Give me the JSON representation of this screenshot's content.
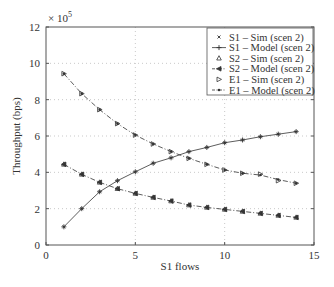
{
  "chart_data": {
    "type": "line",
    "title": "",
    "xlabel": "S1 flows",
    "ylabel": "Throughput (bps)",
    "y_multiplier": "× 10",
    "y_multiplier_exp": "5",
    "xlim": [
      0,
      15
    ],
    "ylim": [
      0,
      12
    ],
    "xticks": [
      0,
      5,
      10,
      15
    ],
    "yticks": [
      0,
      2,
      4,
      6,
      8,
      10,
      12
    ],
    "grid": true,
    "legend_position": "upper right",
    "x": [
      1,
      2,
      3,
      4,
      5,
      6,
      7,
      8,
      9,
      10,
      11,
      12,
      13,
      14
    ],
    "series": [
      {
        "name": "S1 – Sim (scen 2)",
        "marker": "x",
        "line": "none",
        "values": [
          1.0,
          2.0,
          2.93,
          3.54,
          4.03,
          4.5,
          4.8,
          5.14,
          5.37,
          5.63,
          5.78,
          5.96,
          6.1,
          6.24
        ]
      },
      {
        "name": "S1 – Model (scen 2)",
        "marker": "+",
        "line": "solid",
        "values": [
          1.0,
          2.0,
          2.93,
          3.54,
          4.03,
          4.5,
          4.8,
          5.14,
          5.37,
          5.63,
          5.78,
          5.96,
          6.1,
          6.24
        ]
      },
      {
        "name": "S2 – Sim (scen 2)",
        "marker": "triangle-up",
        "line": "none",
        "values": [
          4.44,
          3.89,
          3.45,
          3.1,
          2.84,
          2.62,
          2.42,
          2.2,
          2.07,
          1.96,
          1.85,
          1.74,
          1.63,
          1.52
        ]
      },
      {
        "name": "S2 – Model (scen 2)",
        "marker": "triangle-left",
        "line": "dashdot",
        "values": [
          4.44,
          3.89,
          3.45,
          3.1,
          2.84,
          2.62,
          2.42,
          2.2,
          2.07,
          1.96,
          1.85,
          1.74,
          1.63,
          1.52
        ]
      },
      {
        "name": "E1 – Sim (scen 2)",
        "marker": "triangle-right",
        "line": "none",
        "values": [
          9.43,
          8.33,
          7.45,
          6.68,
          6.05,
          5.56,
          5.14,
          4.77,
          4.44,
          4.13,
          3.95,
          3.9,
          3.54,
          3.4
        ]
      },
      {
        "name": "E1 – Model (scen 2)",
        "marker": "dot",
        "line": "dashdot",
        "values": [
          9.43,
          8.33,
          7.45,
          6.68,
          6.05,
          5.56,
          5.14,
          4.77,
          4.44,
          4.13,
          3.95,
          3.85,
          3.6,
          3.4
        ]
      }
    ]
  }
}
